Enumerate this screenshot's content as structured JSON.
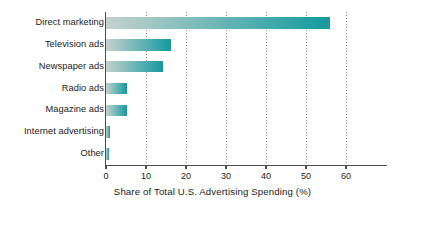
{
  "chart_data": {
    "type": "bar",
    "orientation": "horizontal",
    "title": "",
    "xlabel": "Share of Total U.S. Advertising Spending (%)",
    "ylabel": "",
    "categories": [
      "Direct marketing",
      "Television ads",
      "Newspaper ads",
      "Radio ads",
      "Magazine ads",
      "Internet advertising",
      "Other"
    ],
    "values": [
      56,
      16.3,
      14.3,
      5.3,
      5.2,
      1.1,
      0.8
    ],
    "xlim": [
      0,
      60
    ],
    "xticks": [
      0,
      10,
      20,
      30,
      40,
      50,
      60
    ],
    "xtick_labels": [
      "0",
      "10",
      "20",
      "30",
      "40",
      "50",
      "60"
    ],
    "grid": "vertical-dotted",
    "legend": null,
    "bar_gradient_start": "#c5d2cd",
    "bar_gradient_end": "#139aa0",
    "axis_color": "#4c4c4c",
    "gridline_color": "#8a8a8a",
    "text_color": "#1b1b1b",
    "background": "#ffffff",
    "page_border_color": "#f5f0cf"
  }
}
